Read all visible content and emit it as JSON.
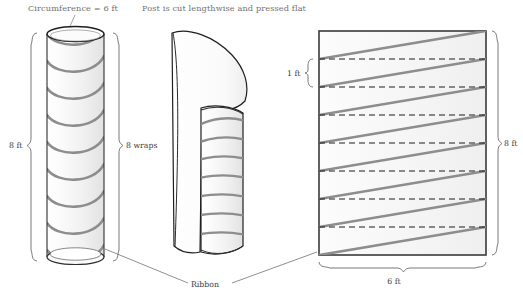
{
  "figure": {
    "title_annotations": {
      "circumference": "Circumference = 6 ft",
      "cut_note": "Post is cut lengthwise and pressed flat",
      "ribbon": "Ribbon"
    },
    "cylinder": {
      "height_label": "8 ft",
      "wraps_label": "8 wraps",
      "wrap_count": 8,
      "circumference_ft": 6,
      "height_ft": 8
    },
    "unrolled_rectangle": {
      "band_height_label": "1 ft",
      "height_label": "8 ft",
      "width_label": "6 ft",
      "band_count": 8,
      "dashed_line_count": 7,
      "diagonal_count": 8,
      "width_ft": 6,
      "height_ft": 8
    },
    "colors": {
      "ribbon": "#8a8a8a",
      "outline": "#3a3a3a",
      "body_fill": "#f4f4f4",
      "annotation_text": "#6f6f6f",
      "dimension_text": "#3d3d3d",
      "dashed": "#222222",
      "brace": "#555555",
      "leader": "#666666",
      "background": "#ffffff"
    }
  }
}
